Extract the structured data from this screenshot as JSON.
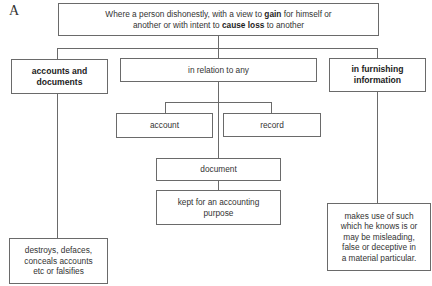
{
  "diagram": {
    "panel_label": "A",
    "root": {
      "line1_pre": "Where a person dishonestly, with a view to ",
      "line1_bold": "gain",
      "line1_post": " for himself or",
      "line2_pre": "another or with intent to ",
      "line2_bold": "cause loss",
      "line2_post": " to another"
    },
    "branches": {
      "left": {
        "title_line1": "accounts and",
        "title_line2": "documents",
        "action_line1": "destroys, defaces,",
        "action_line2": "conceals accounts",
        "action_line3": "etc or falsifies"
      },
      "middle": {
        "title": "in relation to any",
        "options": {
          "account": "account",
          "record": "record"
        },
        "document": "document",
        "purpose_line1": "kept for an accounting",
        "purpose_line2": "purpose"
      },
      "right": {
        "title_line1": "in furnishing",
        "title_line2": "information",
        "action_line1": "makes use of such",
        "action_line2": "which he knows is or",
        "action_line3": "may be misleading,",
        "action_line4": "false or deceptive in",
        "action_line5": "a material particular."
      }
    },
    "colors": {
      "border": "#6a6a6a",
      "text": "#333333",
      "background": "#ffffff"
    }
  }
}
